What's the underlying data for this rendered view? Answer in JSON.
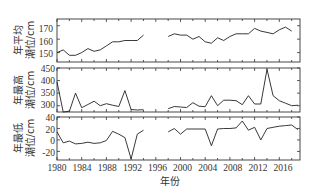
{
  "chart_data": [
    {
      "type": "line",
      "title": "",
      "ylabel": "年平均潮位/cm",
      "xlabel": "",
      "ylim": [
        143,
        175
      ],
      "yticks": [
        150,
        160,
        170
      ],
      "x": [
        1980,
        1981,
        1982,
        1983,
        1984,
        1985,
        1986,
        1987,
        1988,
        1989,
        1990,
        1991,
        1992,
        1993,
        1994,
        1998,
        1999,
        2000,
        2001,
        2002,
        2003,
        2004,
        2005,
        2006,
        2007,
        2008,
        2009,
        2010,
        2011,
        2012,
        2013,
        2014,
        2015,
        2016,
        2017,
        2018,
        2019
      ],
      "values": [
        150,
        152,
        148,
        148,
        150,
        153,
        151,
        152,
        155,
        158,
        158,
        159,
        159,
        159,
        163,
        162,
        164,
        163,
        163,
        160,
        162,
        158,
        157,
        161,
        159,
        162,
        164,
        164,
        164,
        168,
        166,
        165,
        164,
        167,
        169,
        166,
        null
      ],
      "gap": [
        1995,
        1997
      ]
    },
    {
      "type": "line",
      "title": "",
      "ylabel": "年最高潮位/cm",
      "xlabel": "",
      "ylim": [
        275,
        450
      ],
      "yticks": [
        300,
        350,
        400,
        450
      ],
      "x": [
        1980,
        1981,
        1982,
        1983,
        1984,
        1985,
        1986,
        1987,
        1988,
        1989,
        1990,
        1991,
        1992,
        1993,
        1994,
        1998,
        1999,
        2000,
        2001,
        2002,
        2003,
        2004,
        2005,
        2006,
        2007,
        2008,
        2009,
        2010,
        2011,
        2012,
        2013,
        2014,
        2015,
        2016,
        2017,
        2018,
        2019
      ],
      "values": [
        395,
        270,
        278,
        350,
        292,
        305,
        318,
        300,
        308,
        302,
        297,
        360,
        285,
        283,
        284,
        288,
        297,
        295,
        293,
        312,
        298,
        296,
        340,
        300,
        322,
        322,
        320,
        304,
        340,
        307,
        307,
        445,
        340,
        320,
        310,
        300,
        302
      ],
      "gap": [
        1995,
        1997
      ]
    },
    {
      "type": "line",
      "title": "",
      "ylabel": "年最低潮位/cm",
      "xlabel": "年份",
      "ylim": [
        -35,
        40
      ],
      "yticks": [
        -20,
        0,
        20,
        40
      ],
      "xticks": [
        1980,
        1984,
        1988,
        1992,
        1996,
        2000,
        2004,
        2008,
        2012,
        2016
      ],
      "x": [
        1980,
        1981,
        1982,
        1983,
        1984,
        1985,
        1986,
        1987,
        1988,
        1989,
        1990,
        1991,
        1992,
        1993,
        1994,
        1998,
        1999,
        2000,
        2001,
        2002,
        2003,
        2004,
        2005,
        2006,
        2007,
        2008,
        2009,
        2010,
        2011,
        2012,
        2013,
        2014,
        2015,
        2016,
        2017,
        2018,
        2019
      ],
      "values": [
        14,
        -5,
        -2,
        -7,
        -6,
        -4,
        -6,
        -5,
        -1,
        15,
        10,
        4,
        -33,
        10,
        17,
        14,
        20,
        10,
        19,
        19,
        19,
        19,
        -10,
        19,
        20,
        20,
        21,
        33,
        17,
        22,
        0,
        20,
        22,
        24,
        25,
        26,
        18
      ],
      "gap": [
        1995,
        1997
      ]
    }
  ],
  "axis": {
    "xticks": [
      "1980",
      "1984",
      "1988",
      "1992",
      "1996",
      "2000",
      "2004",
      "2008",
      "2012",
      "2016"
    ],
    "xlabel": "年份",
    "panel1": {
      "ylabel_line1": "年平均",
      "ylabel_line2": "潮位/cm",
      "yticks": [
        "170",
        "160",
        "150"
      ]
    },
    "panel2": {
      "ylabel_line1": "年最高",
      "ylabel_line2": "潮位/cm",
      "yticks": [
        "450",
        "400",
        "350",
        "300"
      ]
    },
    "panel3": {
      "ylabel_line1": "年最低",
      "ylabel_line2": "潮位/cm",
      "yticks": [
        "40",
        "20",
        "0",
        "-20"
      ]
    }
  }
}
